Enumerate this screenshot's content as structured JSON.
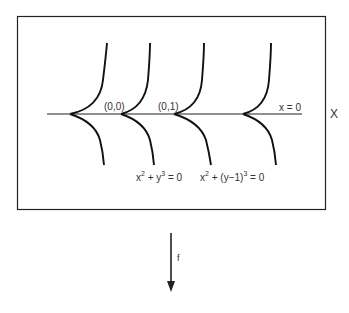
{
  "diagram": {
    "space_label": "X",
    "map_label": "f",
    "line_label": "x = 0",
    "points": [
      {
        "label": "(0,0)"
      },
      {
        "label": "(0,1)"
      }
    ],
    "equations": [
      {
        "base": "x",
        "sup1": "2",
        "mid": " + y",
        "sup2": "3",
        "tail": " = 0"
      },
      {
        "base": "x",
        "sup1": "2",
        "mid": " + (y−1)",
        "sup2": "3",
        "tail": " = 0"
      }
    ],
    "cusp_count": 4,
    "colors": {
      "stroke": "#111111",
      "text": "#333333",
      "background": "#ffffff"
    }
  }
}
